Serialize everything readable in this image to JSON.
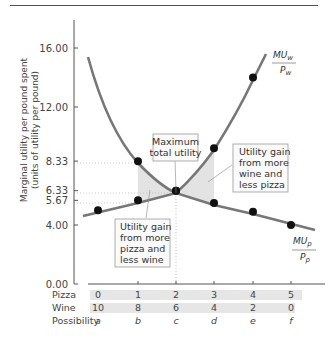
{
  "chart_data": {
    "type": "line",
    "title": "",
    "ylabel": "Marginal utility per pound spent (units of utility per pound)",
    "xlabel": "",
    "ylim": [
      0,
      18
    ],
    "y_ticks": [
      "16.00",
      "12.00",
      "8.33",
      "6.33",
      "5.67",
      "4.00",
      "0.00"
    ],
    "categories": [
      "a",
      "b",
      "c",
      "d",
      "e",
      "f"
    ],
    "table_rows": [
      {
        "label": "Pizza",
        "values": [
          "0",
          "1",
          "2",
          "3",
          "4",
          "5"
        ]
      },
      {
        "label": "Wine",
        "values": [
          "10",
          "8",
          "6",
          "4",
          "2",
          "0"
        ]
      },
      {
        "label": "Possibility",
        "values": [
          "a",
          "b",
          "c",
          "d",
          "e",
          "f"
        ]
      }
    ],
    "series": [
      {
        "name": "MUw/Pw",
        "label_top": "MU",
        "label_sub": "w",
        "label_den": "P",
        "label_den_sub": "w",
        "x": [
          1,
          2,
          3,
          4
        ],
        "values": [
          8.33,
          6.33,
          9.2,
          14.0
        ]
      },
      {
        "name": "MUp/Pp",
        "label_top": "MU",
        "label_sub": "p",
        "label_den": "P",
        "label_den_sub": "p",
        "x": [
          0,
          1,
          2,
          3,
          4,
          5
        ],
        "values": [
          5.0,
          5.67,
          6.33,
          5.5,
          4.9,
          4.0
        ]
      }
    ],
    "annotations": [
      {
        "text": [
          "Maximum",
          "total utility"
        ]
      },
      {
        "text": [
          "Utility gain",
          "from more",
          "wine and",
          "less pizza"
        ]
      },
      {
        "text": [
          "Utility gain",
          "from more",
          "pizza and",
          "less wine"
        ]
      }
    ],
    "grid": false,
    "legend": "inline labels"
  }
}
